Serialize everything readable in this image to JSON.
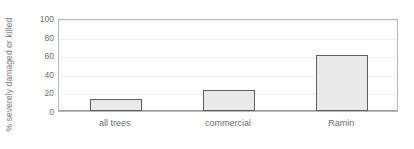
{
  "chart_data": {
    "type": "bar",
    "title": "",
    "xlabel": "",
    "ylabel": "% severely damaged or killed",
    "categories": [
      "all trees",
      "commercial",
      "Ramin"
    ],
    "values": [
      13,
      23,
      60
    ],
    "ylim": [
      0,
      100
    ],
    "yticks": [
      0,
      20,
      40,
      60,
      80,
      100
    ],
    "ytick_labels": [
      "0",
      "20",
      "40",
      "60",
      "80",
      "100"
    ],
    "grid": true,
    "legend": null,
    "series": [
      {
        "name": "% severely damaged or killed",
        "values": [
          13,
          23,
          60
        ]
      }
    ],
    "colors": {
      "bar_fill": "#e9e9e9",
      "bar_border": "#5e5e5e",
      "gridline": "#ededed",
      "frame": "#b9b9b9",
      "text": "#6e6e6e",
      "background": "#ffffff"
    }
  }
}
